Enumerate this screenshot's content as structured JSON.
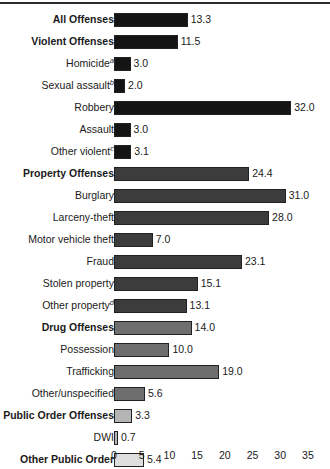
{
  "chart_data": {
    "type": "bar",
    "orientation": "horizontal",
    "title": "",
    "xlabel": "",
    "ylabel": "",
    "xlim": [
      0,
      35
    ],
    "xticks": [
      0,
      5,
      10,
      15,
      20,
      25,
      30,
      35
    ],
    "grid": false,
    "legend": "none",
    "categories": [
      "All Offenses",
      "Violent Offenses",
      "Homicide",
      "Sexual assault",
      "Robbery",
      "Assault",
      "Other violent",
      "Property Offenses",
      "Burglary",
      "Larceny-theft",
      "Motor vehicle theft",
      "Fraud",
      "Stolen property",
      "Other property",
      "Drug Offenses",
      "Possession",
      "Trafficking",
      "Other/unspecified",
      "Public Order Offenses",
      "DWI",
      "Other Public Order"
    ],
    "values": [
      13.3,
      11.5,
      3.0,
      2.0,
      32.0,
      3.0,
      3.1,
      24.4,
      31.0,
      28.0,
      7.0,
      23.1,
      15.1,
      13.1,
      14.0,
      10.0,
      19.0,
      5.6,
      3.3,
      0.7,
      5.4
    ],
    "rows": [
      {
        "label": "All Offenses",
        "footnote": "",
        "value": 13.3,
        "value_text": "13.3",
        "bold": true,
        "color": "#141414"
      },
      {
        "label": "Violent Offenses",
        "footnote": "",
        "value": 11.5,
        "value_text": "11.5",
        "bold": true,
        "color": "#141414"
      },
      {
        "label": "Homicide",
        "footnote": "a",
        "value": 3.0,
        "value_text": "3.0",
        "bold": false,
        "color": "#141414"
      },
      {
        "label": "Sexual assault",
        "footnote": "b",
        "value": 2.0,
        "value_text": "2.0",
        "bold": false,
        "color": "#141414"
      },
      {
        "label": "Robbery",
        "footnote": "",
        "value": 32.0,
        "value_text": "32.0",
        "bold": false,
        "color": "#141414"
      },
      {
        "label": "Assault",
        "footnote": "",
        "value": 3.0,
        "value_text": "3.0",
        "bold": false,
        "color": "#141414"
      },
      {
        "label": "Other violent",
        "footnote": "c",
        "value": 3.1,
        "value_text": "3.1",
        "bold": false,
        "color": "#141414"
      },
      {
        "label": "Property Offenses",
        "footnote": "",
        "value": 24.4,
        "value_text": "24.4",
        "bold": true,
        "color": "#3c3c3c"
      },
      {
        "label": "Burglary",
        "footnote": "",
        "value": 31.0,
        "value_text": "31.0",
        "bold": false,
        "color": "#3c3c3c"
      },
      {
        "label": "Larceny-theft",
        "footnote": "",
        "value": 28.0,
        "value_text": "28.0",
        "bold": false,
        "color": "#3c3c3c"
      },
      {
        "label": "Motor vehicle theft",
        "footnote": "",
        "value": 7.0,
        "value_text": "7.0",
        "bold": false,
        "color": "#3c3c3c"
      },
      {
        "label": "Fraud",
        "footnote": "",
        "value": 23.1,
        "value_text": "23.1",
        "bold": false,
        "color": "#3c3c3c"
      },
      {
        "label": "Stolen property",
        "footnote": "",
        "value": 15.1,
        "value_text": "15.1",
        "bold": false,
        "color": "#3c3c3c"
      },
      {
        "label": "Other property",
        "footnote": "d",
        "value": 13.1,
        "value_text": "13.1",
        "bold": false,
        "color": "#3c3c3c"
      },
      {
        "label": "Drug Offenses",
        "footnote": "",
        "value": 14.0,
        "value_text": "14.0",
        "bold": true,
        "color": "#6e6e6e"
      },
      {
        "label": "Possession",
        "footnote": "",
        "value": 10.0,
        "value_text": "10.0",
        "bold": false,
        "color": "#6e6e6e"
      },
      {
        "label": "Trafficking",
        "footnote": "",
        "value": 19.0,
        "value_text": "19.0",
        "bold": false,
        "color": "#6e6e6e"
      },
      {
        "label": "Other/unspecified",
        "footnote": "",
        "value": 5.6,
        "value_text": "5.6",
        "bold": false,
        "color": "#6e6e6e"
      },
      {
        "label": "Public Order Offenses",
        "footnote": "",
        "value": 3.3,
        "value_text": "3.3",
        "bold": true,
        "color": "#b5b5b5"
      },
      {
        "label": "DWI",
        "footnote": "",
        "value": 0.7,
        "value_text": "0.7",
        "bold": false,
        "color": "#b5b5b5"
      },
      {
        "label": "Other Public Order",
        "footnote": "",
        "value": 5.4,
        "value_text": "5.4",
        "bold": true,
        "color": "#dedede"
      }
    ],
    "axis_tick_labels": [
      "0",
      "5",
      "10",
      "15",
      "20",
      "25",
      "30",
      "35"
    ]
  },
  "layout": {
    "plot_origin_x": 114,
    "px_per_unit": 5.54,
    "row_pitch": 22,
    "bar_height": 14
  }
}
